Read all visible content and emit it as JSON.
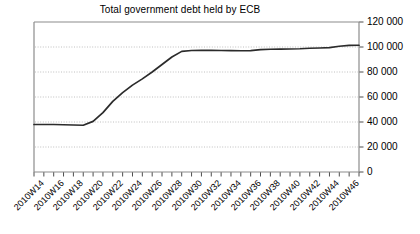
{
  "chart_data": {
    "type": "line",
    "title": "Total government debt held by ECB",
    "xlabel": "",
    "ylabel": "",
    "ylim": [
      0,
      120000
    ],
    "ytick_values": [
      0,
      20000,
      40000,
      60000,
      80000,
      100000,
      120000
    ],
    "ytick_labels": [
      "0",
      "20 000",
      "40 000",
      "60 000",
      "80 000",
      "100 000",
      "120 000"
    ],
    "yaxis_position": "right",
    "grid": "horizontal-dotted",
    "legend": "none",
    "line_color": "#2b2b2b",
    "axis_color": "#808080",
    "grid_color": "#b0b0b0",
    "x": [
      "2010W14",
      "2010W15",
      "2010W16",
      "2010W17",
      "2010W18",
      "2010W19",
      "2010W20",
      "2010W21",
      "2010W22",
      "2010W23",
      "2010W24",
      "2010W25",
      "2010W26",
      "2010W27",
      "2010W28",
      "2010W29",
      "2010W30",
      "2010W31",
      "2010W32",
      "2010W33",
      "2010W34",
      "2010W35",
      "2010W36",
      "2010W37",
      "2010W38",
      "2010W39",
      "2010W40",
      "2010W41",
      "2010W42",
      "2010W43",
      "2010W44",
      "2010W45",
      "2010W46",
      "2010W47"
    ],
    "xtick_labels_shown": [
      "2010W14",
      "2010W16",
      "2010W18",
      "2010W20",
      "2010W22",
      "2010W24",
      "2010W26",
      "2010W28",
      "2010W30",
      "2010W32",
      "2010W34",
      "2010W36",
      "2010W38",
      "2010W40",
      "2010W42",
      "2010W44",
      "2010W46"
    ],
    "xtick_label_rotation_deg": -45,
    "series": [
      {
        "name": "Total government debt held by ECB",
        "values": [
          38000,
          38000,
          38000,
          37800,
          37600,
          37400,
          40500,
          47500,
          56500,
          63500,
          69500,
          74500,
          80000,
          86000,
          92000,
          96500,
          97200,
          97300,
          97300,
          97200,
          97100,
          97000,
          97100,
          97900,
          98200,
          98300,
          98400,
          98600,
          99000,
          99200,
          99500,
          100600,
          101300,
          101400
        ]
      }
    ]
  }
}
